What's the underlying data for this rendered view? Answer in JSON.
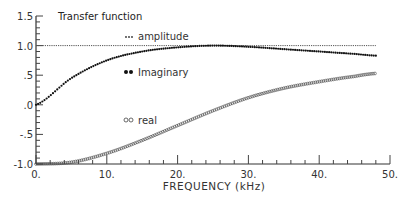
{
  "chart_data": {
    "type": "line",
    "title": "Transfer function",
    "xlabel": "FREQUENCY (kHz)",
    "ylabel": "",
    "xlim": [
      0,
      50
    ],
    "ylim": [
      -1.0,
      1.5
    ],
    "x_ticks": [
      "0.",
      "10.",
      "20.",
      "30.",
      "40.",
      "50."
    ],
    "y_ticks": [
      "1.5",
      "1.0",
      ".5",
      ".0",
      "-.5",
      "-1.0"
    ],
    "grid": false,
    "legend_position": "inline",
    "x": [
      0,
      5,
      10,
      15,
      20,
      25,
      30,
      35,
      40,
      45,
      48
    ],
    "series": [
      {
        "name": "amplitude",
        "marker": "small dots",
        "values": [
          1.0,
          1.0,
          1.0,
          1.0,
          1.0,
          1.0,
          1.0,
          1.0,
          1.0,
          1.0,
          1.0
        ]
      },
      {
        "name": "imaginary",
        "marker": "filled circles",
        "values": [
          0.0,
          0.45,
          0.75,
          0.9,
          0.97,
          1.0,
          0.98,
          0.94,
          0.9,
          0.86,
          0.83
        ]
      },
      {
        "name": "real",
        "marker": "open circles",
        "values": [
          -1.0,
          -0.97,
          -0.82,
          -0.6,
          -0.35,
          -0.1,
          0.12,
          0.28,
          0.39,
          0.48,
          0.53
        ]
      }
    ]
  },
  "legend": {
    "amplitude": "amplitude",
    "imaginary": "Imaginary",
    "real": "real"
  }
}
